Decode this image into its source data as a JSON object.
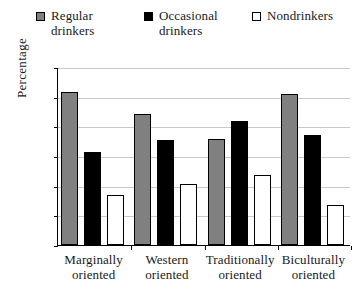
{
  "chart_data": {
    "type": "bar",
    "title": "",
    "xlabel": "",
    "ylabel": "Percentage",
    "ylim": [
      0,
      60
    ],
    "ytick_step": 10,
    "yticks": [
      0,
      10,
      20,
      30,
      40,
      50,
      60
    ],
    "grid": true,
    "legend_position": "top",
    "categories": [
      "Marginally\noriented",
      "Western\noriented",
      "Traditionally\noriented",
      "Biculturally\noriented"
    ],
    "series": [
      {
        "name": "Regular\ndrinkers",
        "legend_label": "Regular\ndrinkers",
        "color": "#808080",
        "marker": "filled-gray-square",
        "values": [
          51.5,
          44.2,
          35.6,
          50.8
        ]
      },
      {
        "name": "Occasional\ndrinkers",
        "legend_label": "Occasional\ndrinkers",
        "color": "#000000",
        "marker": "filled-black-square",
        "values": [
          31.2,
          35.4,
          41.7,
          37.0
        ]
      },
      {
        "name": "Nondrinkers",
        "legend_label": "Nondrinkers",
        "color": "#ffffff",
        "marker": "open-square",
        "values": [
          16.8,
          20.6,
          23.5,
          13.5
        ]
      }
    ]
  },
  "axis": {
    "y_title": "Percentage",
    "y_labels": [
      "60",
      "50",
      "40",
      "30",
      "20",
      "10",
      "0"
    ]
  },
  "legend": {
    "items": [
      {
        "label": "Regular\ndrinkers",
        "swatch": "filled-gray-square"
      },
      {
        "label": "Occasional\ndrinkers",
        "swatch": "filled-black-square"
      },
      {
        "label": "Nondrinkers",
        "swatch": "open-square"
      }
    ]
  },
  "categories": [
    "Marginally\noriented",
    "Western\noriented",
    "Traditionally\noriented",
    "Biculturally\noriented"
  ]
}
